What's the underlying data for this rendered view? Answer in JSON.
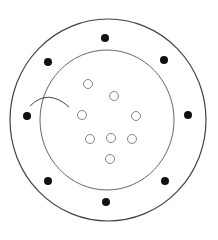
{
  "diagram": {
    "background": "#ffffff",
    "outer_ring": {
      "cx": 108,
      "cy": 120,
      "rx": 98,
      "ry": 101,
      "stroke": "#444444"
    },
    "inner_ring": {
      "cx": 107,
      "cy": 120,
      "rx": 67,
      "ry": 70,
      "stroke": "#666666"
    },
    "arc": {
      "path": "M30 106 Q48 88 69 107",
      "stroke": "#444444"
    },
    "filled_dots": [
      {
        "cx": 105,
        "cy": 38
      },
      {
        "cx": 48,
        "cy": 62
      },
      {
        "cx": 164,
        "cy": 60
      },
      {
        "cx": 27,
        "cy": 116
      },
      {
        "cx": 188,
        "cy": 115
      },
      {
        "cx": 48,
        "cy": 181
      },
      {
        "cx": 165,
        "cy": 181
      },
      {
        "cx": 106,
        "cy": 202
      }
    ],
    "filled_dot_color": "#111111",
    "hollow_dots": [
      {
        "cx": 88,
        "cy": 84
      },
      {
        "cx": 114,
        "cy": 96
      },
      {
        "cx": 82,
        "cy": 115
      },
      {
        "cx": 136,
        "cy": 116
      },
      {
        "cx": 90,
        "cy": 139
      },
      {
        "cx": 111,
        "cy": 138
      },
      {
        "cx": 132,
        "cy": 139
      },
      {
        "cx": 110,
        "cy": 159
      }
    ],
    "hollow_dot_stroke": "#777777"
  }
}
